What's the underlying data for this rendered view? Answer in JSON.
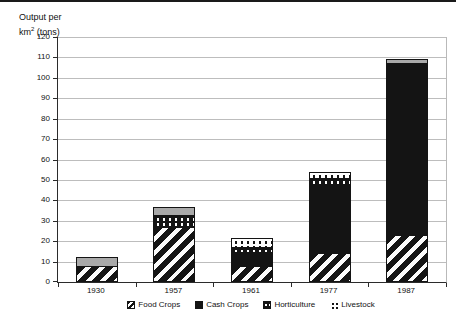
{
  "title": {
    "line1": "Output per",
    "line2_base": "km",
    "line2_sup": "2",
    "line2_rest": " (tons)"
  },
  "chart_data": {
    "type": "bar",
    "stacked": true,
    "ylabel": "Output per km² (tons)",
    "xlabel": "",
    "categories": [
      "1930",
      "1957",
      "1961",
      "1977",
      "1987"
    ],
    "series": [
      {
        "name": "Food Crops",
        "pattern": "hatch",
        "values": [
          8,
          27,
          8,
          14,
          23
        ]
      },
      {
        "name": "Cash Crops",
        "pattern": "solid",
        "values": [
          0,
          0,
          7,
          34,
          85
        ]
      },
      {
        "name": "Horticulture",
        "pattern": "dark-dots",
        "values": [
          0,
          6.5,
          3,
          4,
          0
        ]
      },
      {
        "name": "Livestock",
        "pattern": "light-dots",
        "values": [
          4.5,
          4,
          5,
          3.5,
          2
        ]
      }
    ],
    "totals": [
      12.5,
      37.5,
      23,
      55.5,
      110
    ],
    "ylim": [
      0,
      120
    ],
    "ytick_step": 10,
    "y_ticks": [
      0,
      10,
      20,
      30,
      40,
      50,
      60,
      70,
      80,
      90,
      100,
      110,
      120
    ],
    "grid": "horizontal",
    "legend_position": "bottom"
  },
  "render": {
    "bars": [
      {
        "year": "1930",
        "segments": [
          {
            "category": "Food Crops",
            "pattern": "hatch",
            "value": 8
          },
          {
            "category": "Livestock",
            "pattern": "gray",
            "value": 4.5
          }
        ]
      },
      {
        "year": "1957",
        "segments": [
          {
            "category": "Food Crops",
            "pattern": "hatch",
            "value": 27
          },
          {
            "category": "Horticulture",
            "pattern": "dark-dots",
            "value": 6.5
          },
          {
            "category": "Livestock",
            "pattern": "gray",
            "value": 4
          }
        ]
      },
      {
        "year": "1961",
        "segments": [
          {
            "category": "Food Crops",
            "pattern": "hatch",
            "value": 8
          },
          {
            "category": "Cash Crops",
            "pattern": "solid",
            "value": 7
          },
          {
            "category": "Horticulture",
            "pattern": "dark-dots",
            "value": 3
          },
          {
            "category": "Livestock",
            "pattern": "light-dots",
            "value": 5
          }
        ]
      },
      {
        "year": "1977",
        "segments": [
          {
            "category": "Food Crops",
            "pattern": "hatch",
            "value": 14
          },
          {
            "category": "Cash Crops",
            "pattern": "solid",
            "value": 34
          },
          {
            "category": "Horticulture",
            "pattern": "dark-dots",
            "value": 4
          },
          {
            "category": "Livestock",
            "pattern": "light-dots",
            "value": 3.5
          }
        ]
      },
      {
        "year": "1987",
        "segments": [
          {
            "category": "Food Crops",
            "pattern": "hatch",
            "value": 23
          },
          {
            "category": "Cash Crops",
            "pattern": "solid",
            "value": 85
          },
          {
            "category": "Livestock",
            "pattern": "gray",
            "value": 2
          }
        ]
      }
    ]
  },
  "legend": {
    "items": [
      {
        "label": "Food Crops",
        "pattern": "hatch",
        "bordered": true
      },
      {
        "label": "Cash Crops",
        "pattern": "solid",
        "bordered": true
      },
      {
        "label": "Horticulture",
        "pattern": "dark-dots",
        "bordered": true
      },
      {
        "label": "Livestock",
        "pattern": "light-dots",
        "bordered": false
      }
    ]
  },
  "colors": {
    "bar_black": "#141414",
    "livestock_gray": "#a9a9a9",
    "gridline": "#bdbdbd",
    "axis": "#2b2b2b",
    "background": "#ffffff"
  }
}
